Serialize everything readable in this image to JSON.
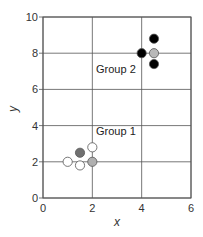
{
  "chart_data": {
    "type": "scatter",
    "title": "",
    "xlabel": "x",
    "ylabel": "y",
    "xlim": [
      0,
      6
    ],
    "ylim": [
      0,
      10
    ],
    "xticks": [
      "0",
      "2",
      "4",
      "6"
    ],
    "yticks": [
      "0",
      "2",
      "4",
      "6",
      "8",
      "10"
    ],
    "grid": true,
    "annotations": [
      {
        "text": "Group 1",
        "x": 2.15,
        "y": 3.5
      },
      {
        "text": "Group 2",
        "x": 2.15,
        "y": 6.9
      }
    ],
    "series": [
      {
        "name": "Group 1",
        "points": [
          {
            "x": 1.0,
            "y": 2.0,
            "color": "#ffffff"
          },
          {
            "x": 1.5,
            "y": 1.8,
            "color": "#ffffff"
          },
          {
            "x": 2.0,
            "y": 2.0,
            "color": "#b0b0b0"
          },
          {
            "x": 1.5,
            "y": 2.5,
            "color": "#707070"
          },
          {
            "x": 2.0,
            "y": 2.8,
            "color": "#ffffff"
          }
        ]
      },
      {
        "name": "Group 2",
        "points": [
          {
            "x": 4.0,
            "y": 8.0,
            "color": "#000000"
          },
          {
            "x": 4.5,
            "y": 8.0,
            "color": "#b8b8b8"
          },
          {
            "x": 4.5,
            "y": 8.8,
            "color": "#000000"
          },
          {
            "x": 4.5,
            "y": 7.4,
            "color": "#000000"
          }
        ]
      }
    ]
  }
}
